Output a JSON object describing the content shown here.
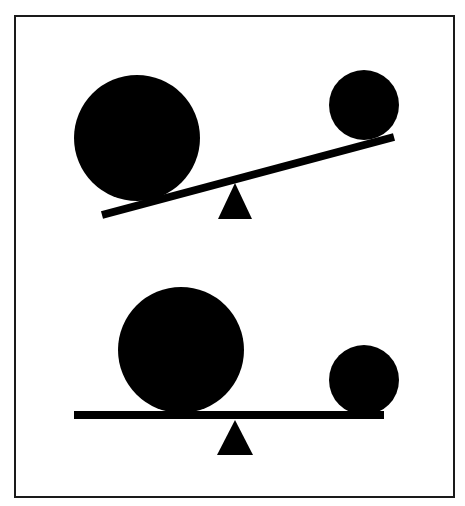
{
  "diagram": {
    "title": "",
    "colors": {
      "background": "#ffffff",
      "ink": "#000000",
      "frame": "#1a1a1a"
    },
    "frame": {
      "x": 15,
      "y": 16,
      "w": 439,
      "h": 481,
      "stroke": 2
    },
    "scenes": [
      {
        "name": "unbalanced-seesaw",
        "big_ball": {
          "cx": 137,
          "cy": 138,
          "r": 63
        },
        "small_ball": {
          "cx": 364,
          "cy": 105,
          "r": 35
        },
        "beam": {
          "x1": 102,
          "y1": 215,
          "x2": 394,
          "y2": 137,
          "thickness": 8
        },
        "fulcrum": {
          "apex": [
            235,
            183
          ],
          "left": [
            218,
            219
          ],
          "right": [
            252,
            219
          ]
        }
      },
      {
        "name": "balanced-seesaw",
        "big_ball": {
          "cx": 181,
          "cy": 350,
          "r": 63
        },
        "small_ball": {
          "cx": 364,
          "cy": 380,
          "r": 35
        },
        "beam": {
          "x1": 74,
          "y1": 415,
          "x2": 384,
          "y2": 415,
          "thickness": 8
        },
        "fulcrum": {
          "apex": [
            235,
            420
          ],
          "left": [
            217,
            455
          ],
          "right": [
            253,
            455
          ]
        }
      }
    ]
  }
}
